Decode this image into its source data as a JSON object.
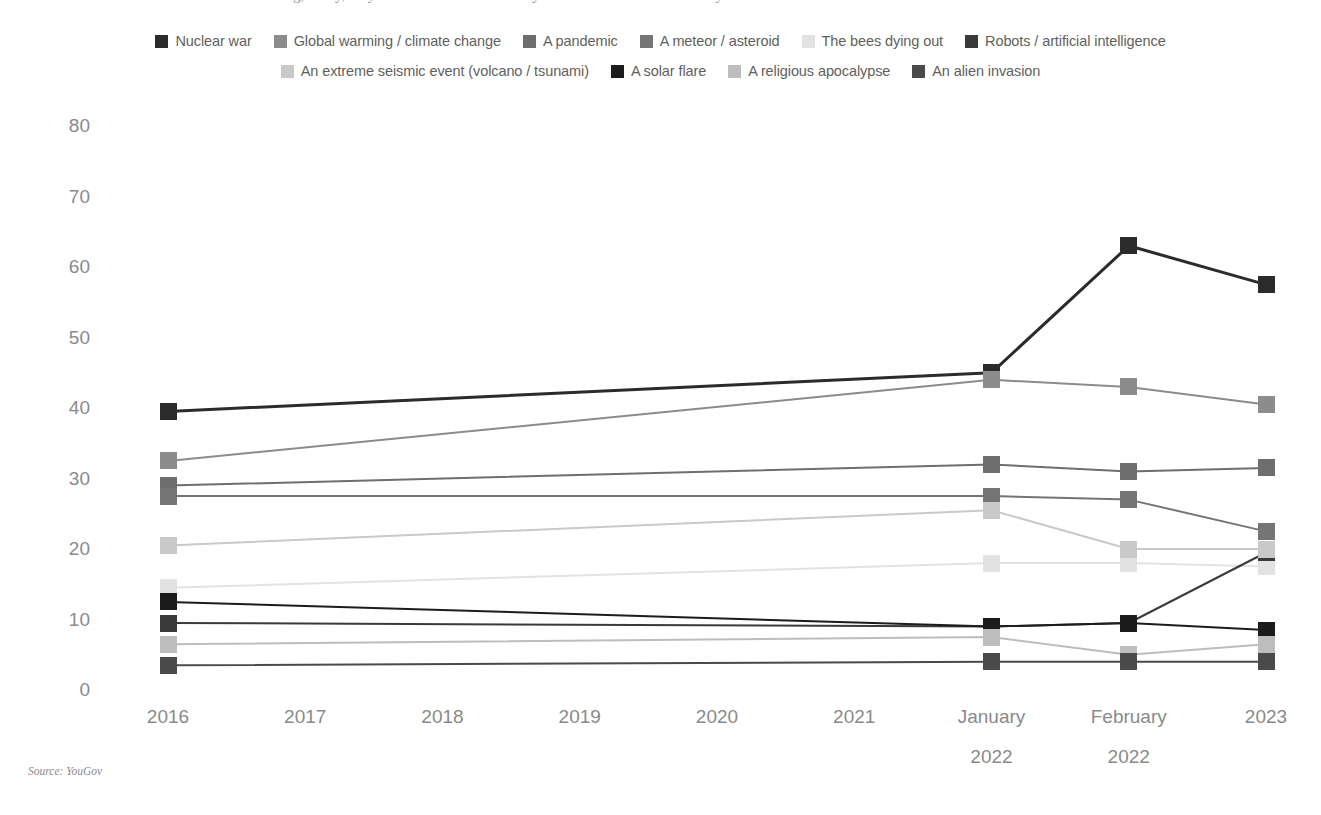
{
  "title": "Which of the following, if any, do you think are the most likely causes of the end of humanity?",
  "source_note": "Source: YouGov",
  "legend": {
    "rows": [
      [
        {
          "label": "Nuclear war",
          "color": "#2b2b2b"
        },
        {
          "label": "Global warming / climate change",
          "color": "#8c8c8c"
        },
        {
          "label": "A pandemic",
          "color": "#6e6e6e"
        },
        {
          "label": "A meteor / asteroid",
          "color": "#757575"
        },
        {
          "label": "The bees dying out",
          "color": "#e2e2e2"
        },
        {
          "label": "Robots / artificial intelligence",
          "color": "#3a3a3a"
        }
      ],
      [
        {
          "label": "An extreme seismic event (volcano / tsunami)",
          "color": "#c9c9c9"
        },
        {
          "label": "A solar flare",
          "color": "#1c1c1c"
        },
        {
          "label": "A religious apocalypse",
          "color": "#bdbdbd"
        },
        {
          "label": "An alien invasion",
          "color": "#4a4a4a"
        }
      ]
    ]
  },
  "chart_data": {
    "type": "line",
    "title": "Which of the following, if any, do you think are the most likely causes of the end of humanity?",
    "xlabel": "",
    "ylabel": "",
    "ylim": [
      0,
      80
    ],
    "yticks": [
      0,
      10,
      20,
      30,
      40,
      50,
      60,
      70,
      80
    ],
    "grid": false,
    "legend_position": "top",
    "categories": [
      "2016",
      "2017",
      "2018",
      "2019",
      "2020",
      "2021",
      "January 2022",
      "February 2022",
      "2023"
    ],
    "category_lines": [
      [
        "2016"
      ],
      [
        "2017"
      ],
      [
        "2018"
      ],
      [
        "2019"
      ],
      [
        "2020"
      ],
      [
        "2021"
      ],
      [
        "January",
        "2022"
      ],
      [
        "February",
        "2022"
      ],
      [
        "2023"
      ]
    ],
    "x_with_data": [
      "2016",
      "January 2022",
      "February 2022",
      "2023"
    ],
    "series": [
      {
        "name": "Nuclear war",
        "color": "#2b2b2b",
        "values": [
          39.5,
          null,
          null,
          null,
          null,
          null,
          45.0,
          63.0,
          57.5
        ]
      },
      {
        "name": "Global warming / climate change",
        "color": "#8c8c8c",
        "values": [
          32.5,
          null,
          null,
          null,
          null,
          null,
          44.0,
          43.0,
          40.5
        ]
      },
      {
        "name": "A pandemic",
        "color": "#6e6e6e",
        "values": [
          29.0,
          null,
          null,
          null,
          null,
          null,
          32.0,
          31.0,
          31.5
        ]
      },
      {
        "name": "A meteor / asteroid",
        "color": "#757575",
        "values": [
          27.5,
          null,
          null,
          null,
          null,
          null,
          27.5,
          27.0,
          22.5
        ]
      },
      {
        "name": "The bees dying out",
        "color": "#e2e2e2",
        "values": [
          14.5,
          null,
          null,
          null,
          null,
          null,
          18.0,
          18.0,
          17.5
        ]
      },
      {
        "name": "Robots / artificial intelligence",
        "color": "#3a3a3a",
        "values": [
          9.5,
          null,
          null,
          null,
          null,
          null,
          9.0,
          9.5,
          19.5
        ]
      },
      {
        "name": "An extreme seismic event (volcano / tsunami)",
        "color": "#c9c9c9",
        "values": [
          20.5,
          null,
          null,
          null,
          null,
          null,
          25.5,
          20.0,
          20.0
        ]
      },
      {
        "name": "A solar flare",
        "color": "#1c1c1c",
        "values": [
          12.5,
          null,
          null,
          null,
          null,
          null,
          9.0,
          9.5,
          8.5
        ]
      },
      {
        "name": "A religious apocalypse",
        "color": "#bdbdbd",
        "values": [
          6.5,
          null,
          null,
          null,
          null,
          null,
          7.5,
          5.0,
          6.5
        ]
      },
      {
        "name": "An alien invasion",
        "color": "#4a4a4a",
        "values": [
          3.5,
          null,
          null,
          null,
          null,
          null,
          4.0,
          4.0,
          4.0
        ]
      }
    ]
  }
}
